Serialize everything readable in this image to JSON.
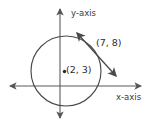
{
  "figure": {
    "type": "geometry-diagram",
    "background_color": "#ffffff",
    "stroke_color": "#4a4a4a",
    "width": 149,
    "height": 132,
    "axes": {
      "x_axis_label": "x-axis",
      "y_axis_label": "y-axis",
      "x_axis_line": {
        "x1": 6,
        "y1": 86,
        "x2": 145,
        "y2": 86,
        "arrows": "both"
      },
      "y_axis_line": {
        "x1": 60,
        "y1": 5,
        "x2": 60,
        "y2": 122,
        "arrows": "both"
      },
      "origin": {
        "x": 60,
        "y": 86
      }
    },
    "circle": {
      "center_px": {
        "x": 66,
        "y": 71
      },
      "radius_px": 35,
      "center_label": "(2, 3)",
      "center_coordinates": {
        "x": 2,
        "y": 3
      }
    },
    "point_on_circle": {
      "label": "(7, 8)",
      "coordinates": {
        "x": 7,
        "y": 8
      },
      "position_px": {
        "x": 96,
        "y": 51
      }
    },
    "line": {
      "description": "double-headed-arrow-through-point",
      "from_px": {
        "x": 73,
        "y": 29
      },
      "to_px": {
        "x": 120,
        "y": 80
      },
      "arrows": "both"
    }
  }
}
